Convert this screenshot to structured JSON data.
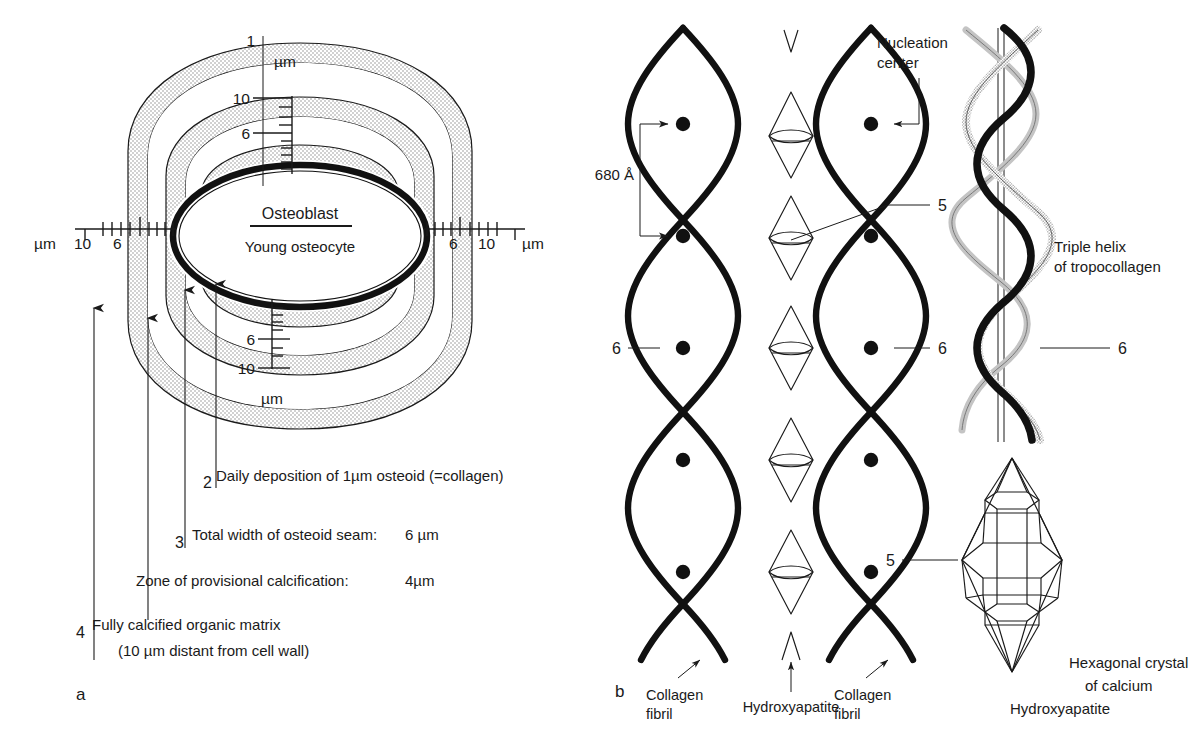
{
  "figure": {
    "panels": [
      {
        "id": "a",
        "label": "a"
      },
      {
        "id": "b",
        "label": "b"
      }
    ]
  },
  "panel_a": {
    "title": "Osteoblast / Young osteocyte cell with osteoid seam and calcification zones",
    "cell_labels": {
      "primary": "Osteoblast",
      "secondary": "Young osteocyte"
    },
    "scales": {
      "unit": "µm",
      "top_value": "1",
      "top_unit": "µm",
      "bottom_unit": "µm",
      "left_unit": "µm",
      "right_unit": "µm",
      "ticks_top": [
        "10",
        "6"
      ],
      "ticks_bottom": [
        "6",
        "10"
      ],
      "ticks_left": [
        "10",
        "6"
      ],
      "ticks_right": [
        "6",
        "10"
      ]
    },
    "legend": [
      {
        "number": "2",
        "text": "Daily deposition of 1µm osteoid (=collagen)",
        "value": ""
      },
      {
        "number": "3",
        "text": "Total width of osteoid seam:",
        "value": "6  µm"
      },
      {
        "number": "",
        "text": "Zone of provisional calcification:",
        "value": "4µm"
      },
      {
        "number": "4",
        "text": "Fully calcified organic matrix",
        "value": ""
      },
      {
        "number": "",
        "text": "(10 µm distant from cell wall)",
        "value": ""
      }
    ]
  },
  "panel_b": {
    "title": "Collagen fibrils, hydroxyapatite crystals and tropocollagen triple helix",
    "labels": {
      "nucleation_center_line1": "Nucleation",
      "nucleation_center_line2": "center",
      "spacing": "680 Å",
      "triple_helix_line1": "Triple helix",
      "triple_helix_line2": "of tropocollagen",
      "collagen_fibril_left_line1": "Collagen",
      "collagen_fibril_left_line2": "fibril",
      "collagen_fibril_right_line1": "Collagen",
      "collagen_fibril_right_line2": "fibril",
      "hydroxyapatite": "Hydroxyapatite",
      "crystal_line1": "Hexagonal crystal",
      "crystal_line2": "of calcium",
      "crystal_line3": "Hydroxyapatite"
    },
    "callouts": [
      {
        "number": "5",
        "target": "hydroxyapatite-crystal-fibril"
      },
      {
        "number": "6",
        "target": "collagen-fibril-left"
      },
      {
        "number": "6",
        "target": "collagen-fibril-right"
      },
      {
        "number": "6",
        "target": "tropocollagen-helix"
      },
      {
        "number": "5",
        "target": "hexagonal-crystal"
      }
    ]
  },
  "colors": {
    "ink": "#1a1a1a",
    "stipple": "#b9b9b9",
    "helix_gray": "#bdbdbd",
    "paper": "#ffffff"
  }
}
